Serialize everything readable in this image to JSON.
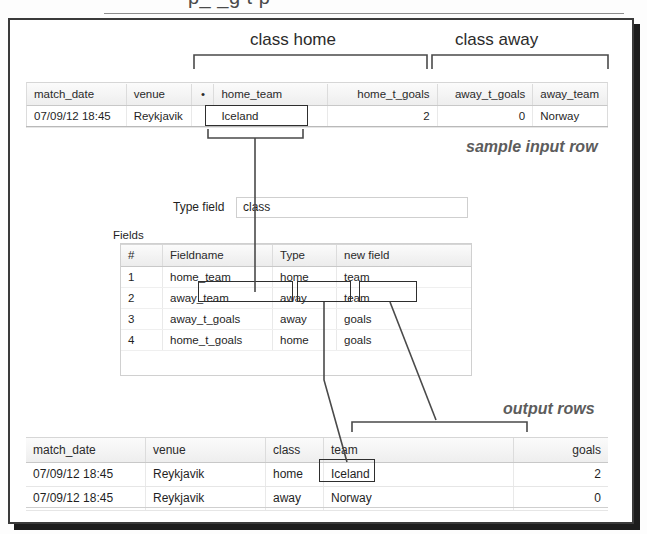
{
  "clipped_top_text": "p_  _g         t              p",
  "annotations": {
    "class_home": "class home",
    "class_away": "class away",
    "sample_input_row": "sample input row",
    "output_rows": "output rows"
  },
  "input_table": {
    "name": "sample-input-table",
    "columns": [
      "match_date",
      "venue",
      "•",
      "home_team",
      "home_t_goals",
      "away_t_goals",
      "away_team"
    ],
    "rows": [
      [
        "07/09/12 18:45",
        "Reykjavik",
        "",
        "Iceland",
        "2",
        "0",
        "Norway"
      ]
    ]
  },
  "type_field": {
    "label": "Type field",
    "value": "class",
    "placeholder": ""
  },
  "fields_section": {
    "label": "Fields",
    "columns": [
      "#",
      "Fieldname",
      "Type",
      "new field"
    ],
    "rows": [
      [
        "1",
        "home_team",
        "home",
        "team"
      ],
      [
        "2",
        "away_team",
        "away",
        "team"
      ],
      [
        "3",
        "away_t_goals",
        "away",
        "goals"
      ],
      [
        "4",
        "home_t_goals",
        "home",
        "goals"
      ]
    ]
  },
  "output_table": {
    "name": "output-rows-table",
    "columns": [
      "match_date",
      "venue",
      "class",
      "team",
      "goals"
    ],
    "rows": [
      [
        "07/09/12 18:45",
        "Reykjavik",
        "home",
        "Iceland",
        "2"
      ],
      [
        "07/09/12 18:45",
        "Reykjavik",
        "away",
        "Norway",
        "0"
      ]
    ]
  },
  "colors": {
    "ink": "#2e2e2e",
    "header_bg": "#efefef",
    "grid": "#e0e0e0",
    "note_text": "#5c5c5c"
  }
}
